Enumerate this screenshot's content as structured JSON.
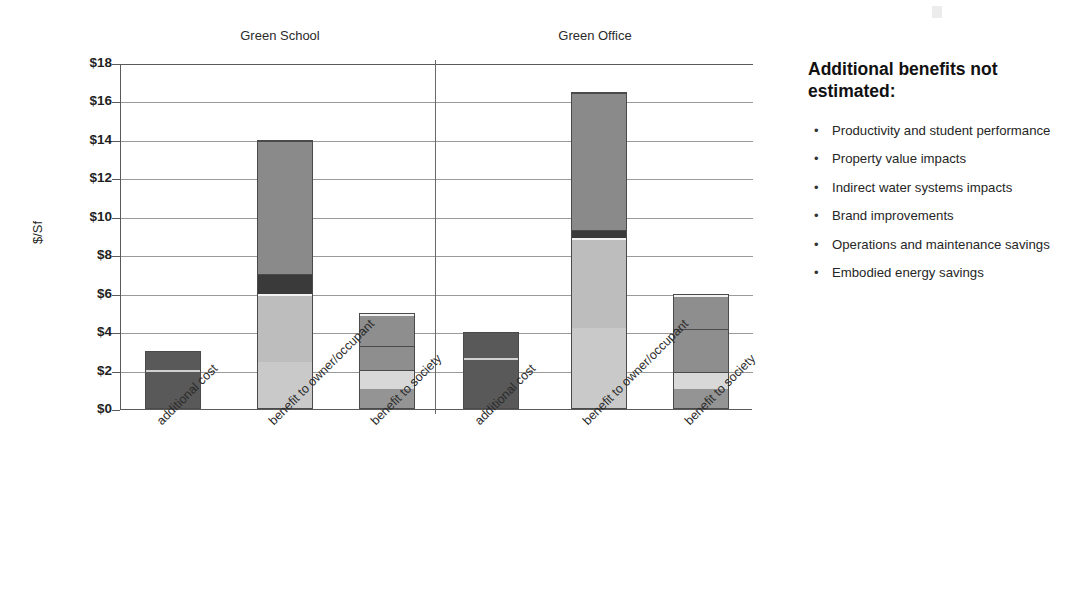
{
  "chart_data": {
    "type": "bar",
    "subtype": "stacked-bar-grouped",
    "title": "",
    "xlabel": "",
    "ylabel": "$/Sf",
    "ylim": [
      0,
      18
    ],
    "ytick_step": 2,
    "ytick_labels": [
      "$0",
      "$2",
      "$4",
      "$6",
      "$8",
      "$10",
      "$12",
      "$14",
      "$16",
      "$18"
    ],
    "grid": true,
    "legend_position": "right-bottom",
    "groups": [
      "Green School",
      "Green Office"
    ],
    "categories": [
      "additional cost",
      "benefit to owner/occupant",
      "benefit to society"
    ],
    "series": [
      {
        "name": "increased building cost",
        "color": "#595959"
      },
      {
        "name": "health",
        "color": "#878787"
      },
      {
        "name": "water savings",
        "color": "#3a3a3a"
      },
      {
        "name": "energy savings",
        "color": "#b9b9b9"
      },
      {
        "name": "indirect energy savings",
        "color": "#8e8e8e"
      },
      {
        "name": "employment",
        "color": "#d8d8d8"
      },
      {
        "name": "emissions",
        "color": "#9c9c9c"
      }
    ],
    "bars": [
      {
        "group": "Green School",
        "category": "additional cost",
        "total": 3.0,
        "segments": [
          {
            "series": "increased building cost",
            "value": 3.0,
            "from": 0,
            "to": 3.0,
            "color": "#595959"
          }
        ]
      },
      {
        "group": "Green School",
        "category": "benefit to owner/occupant",
        "total": 14.0,
        "segments": [
          {
            "series": "employment",
            "value": 2.4,
            "from": 0,
            "to": 2.4,
            "color": "#c9c9c9"
          },
          {
            "series": "energy savings",
            "value": 3.6,
            "from": 2.4,
            "to": 6.0,
            "color": "#bdbdbd"
          },
          {
            "series": "water savings",
            "value": 1.0,
            "from": 6.0,
            "to": 7.0,
            "color": "#3a3a3a"
          },
          {
            "series": "health",
            "value": 7.0,
            "from": 7.0,
            "to": 14.0,
            "color": "#8a8a8a"
          }
        ]
      },
      {
        "group": "Green School",
        "category": "benefit to society",
        "total": 5.0,
        "segments": [
          {
            "series": "emissions",
            "value": 1.0,
            "from": 0,
            "to": 1.0,
            "color": "#949494"
          },
          {
            "series": "employment",
            "value": 1.0,
            "from": 1.0,
            "to": 2.0,
            "color": "#d8d8d8"
          },
          {
            "series": "indirect energy savings",
            "value": 1.3,
            "from": 2.0,
            "to": 3.3,
            "color": "#8e8e8e"
          },
          {
            "series": "health",
            "value": 1.7,
            "from": 3.3,
            "to": 5.0,
            "color": "#8e8e8e"
          }
        ]
      },
      {
        "group": "Green Office",
        "category": "additional cost",
        "total": 4.0,
        "segments": [
          {
            "series": "increased building cost",
            "value": 4.0,
            "from": 0,
            "to": 4.0,
            "color": "#595959"
          }
        ]
      },
      {
        "group": "Green Office",
        "category": "benefit to owner/occupant",
        "total": 16.5,
        "segments": [
          {
            "series": "employment",
            "value": 4.2,
            "from": 0,
            "to": 4.2,
            "color": "#c9c9c9"
          },
          {
            "series": "energy savings",
            "value": 4.7,
            "from": 4.2,
            "to": 8.9,
            "color": "#bdbdbd"
          },
          {
            "series": "water savings",
            "value": 0.4,
            "from": 8.9,
            "to": 9.3,
            "color": "#3a3a3a"
          },
          {
            "series": "health",
            "value": 7.2,
            "from": 9.3,
            "to": 16.5,
            "color": "#8a8a8a"
          }
        ]
      },
      {
        "group": "Green Office",
        "category": "benefit to society",
        "total": 6.0,
        "segments": [
          {
            "series": "emissions",
            "value": 1.0,
            "from": 0,
            "to": 1.0,
            "color": "#949494"
          },
          {
            "series": "employment",
            "value": 0.9,
            "from": 1.0,
            "to": 1.9,
            "color": "#d8d8d8"
          },
          {
            "series": "indirect energy savings",
            "value": 2.3,
            "from": 1.9,
            "to": 4.2,
            "color": "#8e8e8e"
          },
          {
            "series": "health",
            "value": 1.8,
            "from": 4.2,
            "to": 6.0,
            "color": "#8e8e8e"
          }
        ]
      }
    ]
  },
  "chart": {
    "group_titles": [
      "Green School",
      "Green Office"
    ],
    "y_axis_title": "$/Sf",
    "y_ticks": [
      "$18",
      "$16",
      "$14",
      "$12",
      "$10",
      "$8",
      "$6",
      "$4",
      "$2",
      "$0"
    ],
    "x_labels": [
      "additional cost",
      "benefit to owner/occupant",
      "benefit to society",
      "additional cost",
      "benefit to owner/occupant",
      "benefit to society"
    ]
  },
  "legend": {
    "items": [
      {
        "label": "increased building cost",
        "color": "#595959"
      },
      {
        "label": "health",
        "color": "#8a8a8a"
      },
      {
        "label": "water savings",
        "color": "#3a3a3a"
      },
      {
        "label": "energy savings",
        "color": "#c2c2c2"
      },
      {
        "label": "indirect energy savings",
        "color": "#8e8e8e"
      },
      {
        "label": "employment",
        "color": "#dedede"
      },
      {
        "label": "emissions",
        "color": "#9c9c9c"
      }
    ]
  },
  "side_panel": {
    "heading": "Additional benefits not estimated:",
    "bullet": "•",
    "items": [
      "Productivity and student performance",
      "Property value impacts",
      "Indirect water systems impacts",
      "Brand improvements",
      "Operations and maintenance savings",
      "Embodied energy savings"
    ]
  }
}
